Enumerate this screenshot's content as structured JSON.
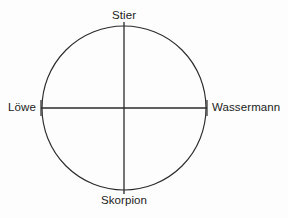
{
  "figure": {
    "kind": "zodiac-cross-diagram",
    "background_color": "#fdfdfd",
    "stroke_color": "#2b2b2b",
    "text_color": "#1b1b1b"
  },
  "labels": {
    "top": "Stier",
    "right": "Wassermann",
    "bottom": "Skorpion",
    "left": "Löwe"
  },
  "chart_data": {
    "type": "scatter",
    "title": "",
    "xlabel": "",
    "ylabel": "",
    "grid": false,
    "legend": "none",
    "geometry": {
      "circle": {
        "cx": 124,
        "cy": 108,
        "r": 82
      },
      "vertical_axis": {
        "x": 124,
        "y1": 22,
        "y2": 194
      },
      "horizontal_axis": {
        "y": 108,
        "x1": 41,
        "x2": 207
      },
      "end_ticks": true
    },
    "categories": [
      "Stier",
      "Wassermann",
      "Skorpion",
      "Löwe"
    ],
    "points": [
      {
        "label": "Stier",
        "position": "top",
        "angle_deg": 90,
        "x": 124,
        "y": 26
      },
      {
        "label": "Wassermann",
        "position": "right",
        "angle_deg": 0,
        "x": 206,
        "y": 108
      },
      {
        "label": "Skorpion",
        "position": "bottom",
        "angle_deg": 270,
        "x": 124,
        "y": 190
      },
      {
        "label": "Löwe",
        "position": "left",
        "angle_deg": 180,
        "x": 42,
        "y": 108
      }
    ]
  }
}
